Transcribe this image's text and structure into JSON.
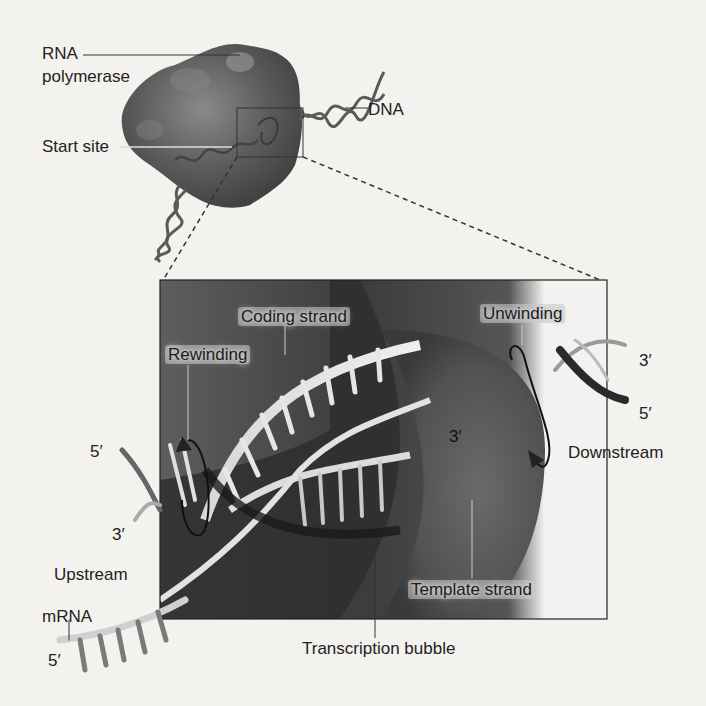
{
  "figure": {
    "overview": {
      "labels": {
        "rna_polymerase_line1": "RNA",
        "rna_polymerase_line2": "polymerase",
        "dna": "DNA",
        "start_site": "Start site"
      }
    },
    "inset": {
      "labels": {
        "coding_strand": "Coding strand",
        "rewinding": "Rewinding",
        "unwinding": "Unwinding",
        "template_strand": "Template strand",
        "transcription_bubble": "Transcription bubble",
        "upstream": "Upstream",
        "downstream": "Downstream",
        "mrna": "mRNA",
        "left_5prime": "5′",
        "left_3prime": "3′",
        "right_3prime": "3′",
        "right_5prime": "5′",
        "center_3prime": "3′",
        "mrna_5prime": "5′"
      }
    },
    "colors": {
      "page_background": "#f3f2ef",
      "polymerase": "#5a5a5a",
      "inset_dark": "#3a3a3a",
      "label_text": "#222222"
    }
  }
}
